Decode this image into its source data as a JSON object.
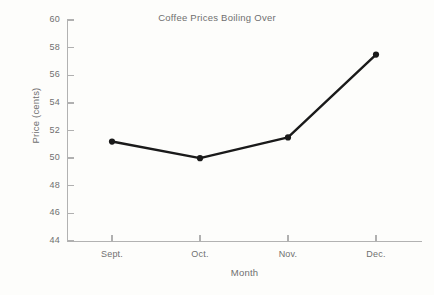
{
  "chart_data": {
    "type": "line",
    "title": "Coffee Prices Boiling Over",
    "xlabel": "Month",
    "ylabel": "Price (cents)",
    "categories": [
      "Sept.",
      "Oct.",
      "Nov.",
      "Dec."
    ],
    "values": [
      51.2,
      50.0,
      51.5,
      57.5
    ],
    "ylim": [
      44,
      60
    ],
    "yticks": [
      44,
      46,
      48,
      50,
      52,
      54,
      56,
      58,
      60
    ],
    "grid": false,
    "legend": "none",
    "series": [
      {
        "name": "Coffee price",
        "values": [
          51.2,
          50.0,
          51.5,
          57.5
        ]
      }
    ],
    "style": {
      "line_color": "#1a1a1a",
      "marker_color": "#1a1a1a",
      "axis_color": "#b2b2b2",
      "text_color": "#6f6f6f",
      "background": "#fdfdfb"
    }
  }
}
